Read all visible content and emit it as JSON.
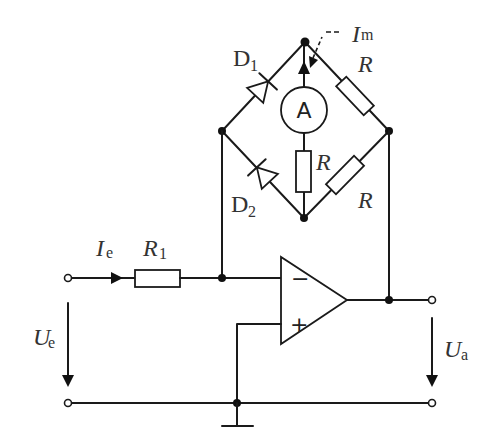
{
  "diagram": {
    "type": "circuit",
    "labels": {
      "D1": {
        "main": "D",
        "sub": "1"
      },
      "D2": {
        "main": "D",
        "sub": "2"
      },
      "Im": {
        "main": "I",
        "sub": "m"
      },
      "Ie": {
        "main": "I",
        "sub": "e"
      },
      "R1": {
        "main": "R",
        "sub": "1"
      },
      "R_top_right": "R",
      "R_center": "R",
      "R_bottom_right": "R",
      "Ue": {
        "main": "U",
        "sub": "e"
      },
      "Ua": {
        "main": "U",
        "sub": "a"
      },
      "ammeter": "A",
      "opamp_minus": "−",
      "opamp_plus": "+"
    },
    "colors": {
      "wire": "#1a1a1a",
      "text": "#333333",
      "background": "#ffffff"
    }
  }
}
